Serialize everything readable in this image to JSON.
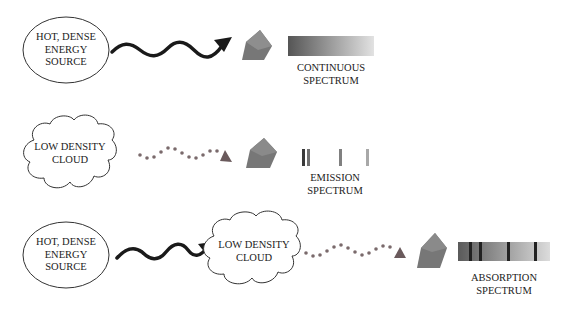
{
  "colors": {
    "background": "#ffffff",
    "outline": "#333333",
    "wave_solid": "#1a1a1a",
    "wave_dotted": "#7a6a6c",
    "prism": "#777777",
    "prism_facet": "#8e8e8e",
    "spectrum_dark": "#505050",
    "spectrum_light": "#dedede",
    "line_dark": "#2a2a2a"
  },
  "rows": [
    {
      "id": "continuous",
      "source": {
        "shape": "ellipse",
        "lines": [
          "HOT, DENSE",
          "ENERGY",
          "SOURCE"
        ]
      },
      "arrow_style": "solid-wave",
      "spectrum": {
        "type": "continuous",
        "caption": [
          "CONTINUOUS",
          "SPECTRUM"
        ]
      }
    },
    {
      "id": "emission",
      "source": {
        "shape": "cloud",
        "lines": [
          "LOW DENSITY",
          "CLOUD"
        ]
      },
      "arrow_style": "dotted-wave",
      "spectrum": {
        "type": "emission",
        "caption": [
          "EMISSION",
          "SPECTRUM"
        ],
        "line_positions_px": [
          302,
          307,
          339,
          366
        ]
      }
    },
    {
      "id": "absorption",
      "source": {
        "shape": "ellipse",
        "lines": [
          "HOT, DENSE",
          "ENERGY",
          "SOURCE"
        ]
      },
      "arrow_style": "solid-wave",
      "intermediate": {
        "shape": "cloud",
        "lines": [
          "LOW DENSITY",
          "CLOUD"
        ]
      },
      "arrow2_style": "dotted-wave",
      "spectrum": {
        "type": "absorption",
        "caption": [
          "ABSORPTION",
          "SPECTRUM"
        ],
        "line_positions_px": [
          470,
          480,
          508,
          535
        ]
      }
    }
  ]
}
